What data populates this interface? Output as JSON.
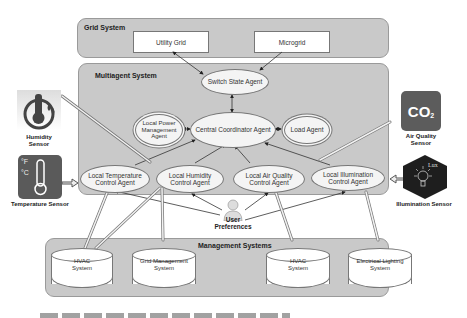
{
  "grid_system": {
    "title": "Grid System",
    "nodes": [
      "Utility Grid",
      "Microgrid"
    ]
  },
  "multiagent_system": {
    "title": "Multiagent System",
    "agents": {
      "switch_state": "Switch State Agent",
      "central_coordinator": "Central Coordinator Agent",
      "local_power": "Local Power Management Agent",
      "load": "Load Agent",
      "local_temperature": "Local Temperature Control Agent",
      "local_humidity": "Local Humidity Control Agent",
      "local_air_quality": "Local Air Quality Control Agent",
      "local_illumination": "Local Illumination Control Agent"
    }
  },
  "management_systems": {
    "title": "Management Systems",
    "nodes": [
      "HVAC System",
      "Grid Management System",
      "HVAC System",
      "Electrical Lighting System"
    ]
  },
  "sensors": {
    "humidity": "Humidity Sensor",
    "temperature": "Temperature Sensor",
    "air_quality": "Air Quality Sensor",
    "illumination": "Illumination Sensor",
    "co2_glyph": "CO",
    "co2_sub": "2",
    "temp_f": "°F",
    "temp_c": "°C",
    "lux": "Lux"
  },
  "user": {
    "label": "User Preferences"
  },
  "colors": {
    "panel": "#c9c9c9",
    "sensor_dark": "#5a5a5a",
    "illumination_dark": "#1e1e1e"
  }
}
